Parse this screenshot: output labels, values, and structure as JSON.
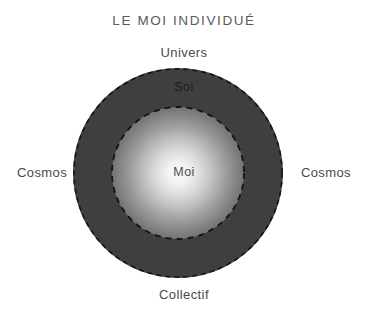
{
  "diagram": {
    "title": "LE MOI INDIVIDUÉ",
    "type": "concentric-circles",
    "labels": {
      "top_outside": "Univers",
      "bottom_outside": "Collectif",
      "left_outside": "Cosmos",
      "right_outside": "Cosmos",
      "outer_ring": "Soi",
      "center": "Moi"
    },
    "colors": {
      "background": "#ffffff",
      "outer_ring_fill": "#3f3f3f",
      "dashed_stroke": "#141414",
      "core_highlight": "#fbfbfb",
      "title_text": "#5a5a5a",
      "outside_label_text": "#4a4a4a",
      "outer_ring_label_text": "#1d1d1d",
      "center_label_text": "#4d4d4d"
    },
    "geometry": {
      "center_x": 178,
      "center_y": 173,
      "outer_radius": 105,
      "inner_radius": 66,
      "outer_dash_pattern": "5 4",
      "inner_dash_pattern": "6 5"
    }
  }
}
